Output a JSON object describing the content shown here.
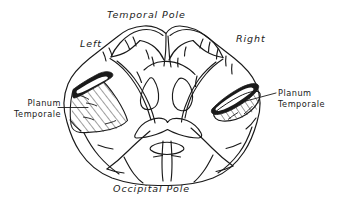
{
  "figure": {
    "type": "anatomical-line-drawing",
    "orientation_labels": {
      "top": "Temporal Pole",
      "bottom": "Occipital Pole",
      "left_hemisphere": "Left",
      "right_hemisphere": "Right"
    },
    "callouts": [
      {
        "id": "planum-left",
        "line1": "Planum",
        "line2": "Temporale",
        "side": "left",
        "leader": "horizontal line from text to hatched region"
      },
      {
        "id": "planum-right",
        "line1": "Planum",
        "line2": "Temporale",
        "side": "right",
        "leader": "angled line from hatched region to text"
      }
    ],
    "regions": {
      "left_planum_shape": "broad fan / triangular hatched area",
      "right_planum_shape": "narrow elongated hatched band"
    },
    "colors": {
      "ink": "#1a1a1a",
      "paper": "#ffffff",
      "hatch": "#1a1a1a"
    }
  }
}
